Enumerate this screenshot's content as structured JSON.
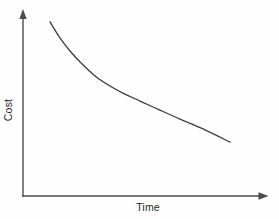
{
  "figure": {
    "background": "#fefefe",
    "axis_color": "#4b4b4b",
    "curve_color": "#3c3c3c",
    "label_color": "#1f1f1f"
  },
  "chart_data": {
    "type": "line",
    "title": "",
    "xlabel": "Time",
    "ylabel": "Cost",
    "x_axis": {
      "label": "Time",
      "tick_labels": [],
      "has_arrow": true
    },
    "y_axis": {
      "label": "Cost",
      "tick_labels": [],
      "has_arrow": true
    },
    "x_range": [
      0,
      1
    ],
    "y_range": [
      0,
      1
    ],
    "grid": false,
    "legend": null,
    "series": [
      {
        "name": "cost-vs-time",
        "shape": "smooth-convex-decay",
        "points": [
          [
            0.11,
            0.946
          ],
          [
            0.151,
            0.859
          ],
          [
            0.192,
            0.788
          ],
          [
            0.233,
            0.728
          ],
          [
            0.294,
            0.652
          ],
          [
            0.355,
            0.598
          ],
          [
            0.416,
            0.554
          ],
          [
            0.478,
            0.516
          ],
          [
            0.559,
            0.467
          ],
          [
            0.641,
            0.418
          ],
          [
            0.743,
            0.359
          ],
          [
            0.845,
            0.293
          ]
        ]
      }
    ]
  }
}
